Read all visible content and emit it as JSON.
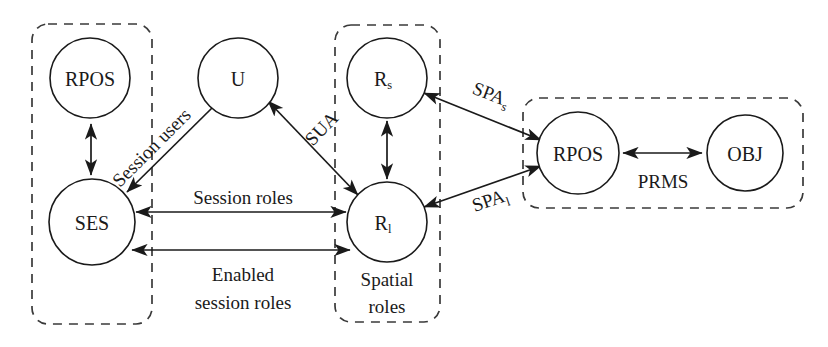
{
  "diagram": {
    "background_color": "#ffffff",
    "stroke_color": "#1a1a1a",
    "dashed_box_color": "#3a3a3a",
    "nodes": [
      {
        "id": "rpos_left",
        "label": "RPOS",
        "sub": "",
        "cx": 90,
        "cy": 78,
        "r": 40
      },
      {
        "id": "ses",
        "label": "SES",
        "sub": "",
        "cx": 92,
        "cy": 222,
        "r": 43
      },
      {
        "id": "u",
        "label": "U",
        "sub": "",
        "cx": 238,
        "cy": 78,
        "r": 40
      },
      {
        "id": "rs",
        "label": "R",
        "sub": "s",
        "cx": 387,
        "cy": 78,
        "r": 40
      },
      {
        "id": "rl",
        "label": "R",
        "sub": "l",
        "cx": 387,
        "cy": 222,
        "r": 40
      },
      {
        "id": "rpos_right",
        "label": "RPOS",
        "sub": "",
        "cx": 578,
        "cy": 153,
        "r": 41
      },
      {
        "id": "obj",
        "label": "OBJ",
        "sub": "",
        "cx": 745,
        "cy": 153,
        "r": 38
      }
    ],
    "groups": [
      {
        "id": "group_left",
        "x": 32,
        "y": 24,
        "w": 120,
        "h": 300
      },
      {
        "id": "group_middle",
        "x": 335,
        "y": 25,
        "w": 105,
        "h": 297
      },
      {
        "id": "group_right",
        "x": 523,
        "y": 98,
        "w": 280,
        "h": 110
      }
    ],
    "captions": [
      {
        "id": "spatial_roles_caption",
        "line1": "Spatial",
        "line2": "roles",
        "x": 387,
        "y": 283
      }
    ],
    "edges": [
      {
        "id": "rpos_ses",
        "label": "",
        "sub": "",
        "arrows": "both"
      },
      {
        "id": "u_ses",
        "label": "Session users",
        "sub": "",
        "arrows": "end"
      },
      {
        "id": "rl_u",
        "label": "SUA",
        "sub": "",
        "arrows": "both"
      },
      {
        "id": "rs_rl",
        "label": "",
        "sub": "",
        "arrows": "both"
      },
      {
        "id": "ses_rl_top",
        "label": "Session roles",
        "sub": "",
        "arrows": "both"
      },
      {
        "id": "ses_rl_bottom",
        "label_line1": "Enabled",
        "label_line2": "session roles",
        "sub": "",
        "arrows": "both"
      },
      {
        "id": "rs_rpos",
        "label": "SPA",
        "sub": "s",
        "arrows": "both"
      },
      {
        "id": "rl_rpos",
        "label": "SPA",
        "sub": "l",
        "arrows": "both"
      },
      {
        "id": "rpos_obj",
        "label": "PRMS",
        "sub": "",
        "arrows": "both"
      }
    ],
    "labels": {
      "session_users": "Session users",
      "sua": "SUA",
      "session_roles": "Session roles",
      "enabled_line1": "Enabled",
      "enabled_line2": "session roles",
      "spa_base": "SPA",
      "spa_s_sub": "s",
      "spa_l_sub": "l",
      "prms": "PRMS",
      "spatial_line1": "Spatial",
      "spatial_line2": "roles"
    }
  }
}
